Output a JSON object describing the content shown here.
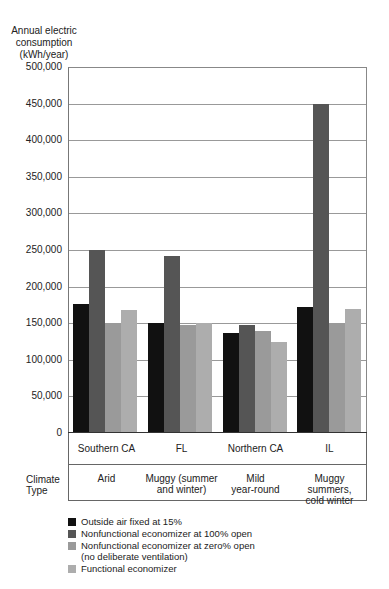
{
  "chart_data": {
    "type": "bar",
    "title": "",
    "ylabel": "Annual electric consumption (kWh/year)",
    "xlabel": "",
    "ylim": [
      0,
      500000
    ],
    "yticks": [
      0,
      50000,
      100000,
      150000,
      200000,
      250000,
      300000,
      350000,
      400000,
      450000,
      500000
    ],
    "grid": true,
    "legend_position": "bottom",
    "categories": [
      "Southern CA",
      "FL",
      "Northern CA",
      "IL"
    ],
    "climate_type": [
      "Arid",
      "Muggy (summer and winter)",
      "Mild year-round",
      "Muggy summers, cold winter"
    ],
    "series": [
      {
        "name": "Outside air fixed at 15%",
        "color": "#111111",
        "values": [
          176000,
          150000,
          136000,
          172000
        ]
      },
      {
        "name": "Nonfunctional economizer at 100% open",
        "color": "#555555",
        "values": [
          250000,
          242000,
          147000,
          450000
        ]
      },
      {
        "name": "Nonfunctional economizer at zero% open (no deliberate ventilation)",
        "color": "#9a9a9a",
        "values": [
          150000,
          148000,
          140000,
          150000
        ]
      },
      {
        "name": "Functional economizer",
        "color": "#adadad",
        "values": [
          168000,
          150000,
          124000,
          169000
        ]
      }
    ]
  },
  "axis": {
    "ylabel_lines": [
      "Annual electric",
      "consumption",
      "(kWh/year)"
    ],
    "tick_labels": [
      "500,000",
      "450,000",
      "400,000",
      "350,000",
      "300,000",
      "250,000",
      "200,000",
      "150,000",
      "100,000",
      "50,000",
      "0"
    ]
  },
  "table": {
    "row_label_lines": [
      "Climate",
      "Type"
    ],
    "locations": [
      "Southern CA",
      "FL",
      "Northern CA",
      "IL"
    ],
    "climates": [
      [
        "Arid",
        ""
      ],
      [
        "Muggy (summer",
        "and winter)"
      ],
      [
        "Mild",
        "year-round"
      ],
      [
        "Muggy summers,",
        "cold winter"
      ]
    ]
  },
  "legend": [
    {
      "lines": [
        "Outside air fixed at 15%"
      ],
      "color": "#111111"
    },
    {
      "lines": [
        "Nonfunctional economizer at 100% open"
      ],
      "color": "#555555"
    },
    {
      "lines": [
        "Nonfunctional economizer at zero% open",
        "(no deliberate ventilation)"
      ],
      "color": "#9a9a9a"
    },
    {
      "lines": [
        "Functional economizer"
      ],
      "color": "#adadad"
    }
  ]
}
